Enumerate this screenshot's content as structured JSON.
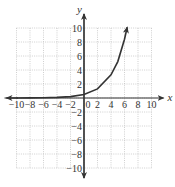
{
  "chart_data": {
    "type": "line",
    "title": "",
    "xlabel": "x",
    "ylabel": "y",
    "xlim": [
      -10,
      10
    ],
    "ylim": [
      -10,
      10
    ],
    "grid": true,
    "grid_style": "dotted",
    "x_ticks": [
      -10,
      -8,
      -6,
      -4,
      -2,
      0,
      2,
      4,
      6,
      8,
      10
    ],
    "y_ticks": [
      -10,
      -8,
      -6,
      -4,
      -2,
      2,
      4,
      6,
      8,
      10
    ],
    "x_tick_labels": [
      "−10",
      "−8",
      "−6",
      "−4",
      "−2",
      "0",
      "2",
      "4",
      "6",
      "8",
      "10"
    ],
    "y_tick_labels": [
      "−10",
      "−8",
      "−6",
      "−4",
      "−2",
      "2",
      "4",
      "6",
      "8",
      "10"
    ],
    "series": [
      {
        "name": "exponential curve",
        "description": "exponential growth curve approaching 0 as x→−∞, with arrows at both ends",
        "x": [
          -10,
          -8,
          -6,
          -4,
          -2,
          0,
          2,
          4,
          5,
          6,
          6.4
        ],
        "y": [
          0.0,
          0.01,
          0.03,
          0.08,
          0.2,
          0.5,
          1.3,
          3.3,
          5.2,
          8.4,
          10.1
        ]
      }
    ]
  },
  "axes": {
    "x_label": "x",
    "y_label": "y"
  },
  "colors": {
    "axis": "#333333",
    "grid": "#bbbbbb",
    "curve": "#333333"
  }
}
